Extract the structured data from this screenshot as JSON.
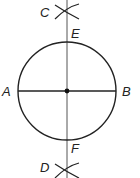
{
  "diagram": {
    "type": "geometric-construction",
    "colors": {
      "stroke": "#222222",
      "axis": "#555555",
      "point": "#111111"
    },
    "circle": {
      "cx": 67,
      "cy": 91,
      "r": 49
    },
    "points": [
      {
        "id": "A",
        "label": "A",
        "x": 18,
        "y": 91
      },
      {
        "id": "B",
        "label": "B",
        "x": 116,
        "y": 91
      },
      {
        "id": "C",
        "label": "C",
        "x": 67,
        "y": 10
      },
      {
        "id": "D",
        "label": "D",
        "x": 67,
        "y": 170
      },
      {
        "id": "E",
        "label": "E",
        "x": 67,
        "y": 42
      },
      {
        "id": "F",
        "label": "F",
        "x": 67,
        "y": 140
      }
    ],
    "labels": {
      "A": "A",
      "B": "B",
      "C": "C",
      "D": "D",
      "E": "E",
      "F": "F"
    }
  }
}
